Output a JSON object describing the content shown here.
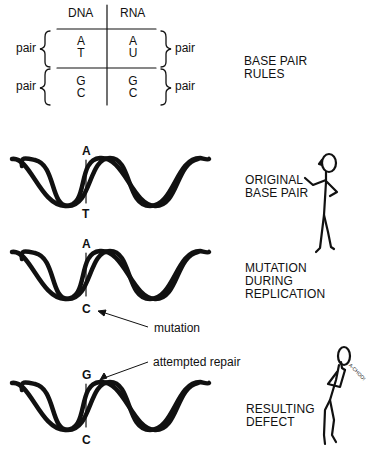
{
  "table": {
    "headers": [
      "DNA",
      "RNA"
    ],
    "rows": [
      {
        "dna": [
          "A",
          "T"
        ],
        "rna": [
          "A",
          "U"
        ],
        "left_label": "pair",
        "right_label": "pair"
      },
      {
        "dna": [
          "G",
          "C"
        ],
        "rna": [
          "G",
          "C"
        ],
        "left_label": "pair",
        "right_label": "pair"
      }
    ]
  },
  "panels": [
    {
      "title_lines": [
        "BASE PAIR",
        "RULES"
      ]
    },
    {
      "title_lines": [
        "ORIGINAL",
        "BASE PAIR"
      ],
      "top_base": "A",
      "bottom_base": "T"
    },
    {
      "title_lines": [
        "MUTATION",
        "DURING",
        "REPLICATION"
      ],
      "top_base": "A",
      "bottom_base": "C",
      "annotation": "mutation"
    },
    {
      "title_lines": [
        "RESULTING",
        "DEFECT"
      ],
      "top_base": "G",
      "bottom_base": "C",
      "annotation": "attempted repair",
      "speech": "A-CHOO!"
    }
  ],
  "colors": {
    "ink": "#111111",
    "background": "#ffffff"
  }
}
